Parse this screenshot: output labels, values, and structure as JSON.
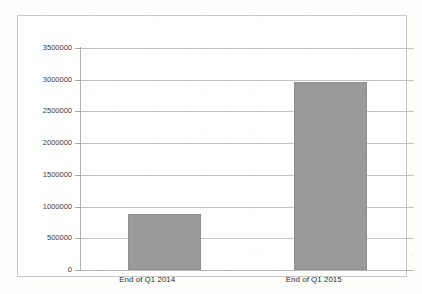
{
  "chart_data": {
    "type": "bar",
    "title": "",
    "subtitle": "",
    "xlabel": "",
    "ylabel": "",
    "categories": [
      "End of Q1 2014",
      "End of Q1 2015"
    ],
    "values": [
      880000,
      2965000
    ],
    "series": [
      {
        "name": "",
        "values": [
          880000,
          2965000
        ]
      }
    ],
    "ylim": [
      0,
      3500000
    ],
    "ytick_step": 500000,
    "ytick_labels": [
      "3500000",
      "3000000",
      "2500000",
      "2000000",
      "1500000",
      "1000000",
      "500000",
      "0"
    ],
    "ytick_values": [
      3500000,
      3000000,
      2500000,
      2000000,
      1500000,
      1000000,
      500000,
      0
    ],
    "grid": true,
    "grid_axis": "y",
    "legend": false,
    "legend_position": "none",
    "annotations": [],
    "bar_color": "#9a9a9a",
    "gridline_color": "#c2c2c2",
    "axis_color": "#b0b0b0",
    "border_color": "#c9c9c9",
    "background_color": "#ffffff",
    "text_color": "#2f2f2f"
  }
}
